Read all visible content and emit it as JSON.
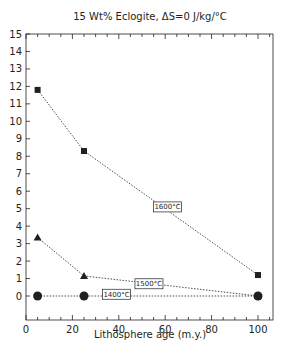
{
  "chart_data": {
    "type": "line",
    "title": "15 Wt% Eclogite, ΔS=0 J/kg/°C",
    "xlabel": "Lithosphere age (m.y.)",
    "ylabel": "",
    "xlim": [
      0,
      106
    ],
    "ylim": [
      0,
      15
    ],
    "xticks": [
      0,
      20,
      40,
      60,
      80,
      100
    ],
    "xtick_labels": [
      "0",
      "20",
      "40",
      "60",
      "80",
      "100"
    ],
    "yticks": [
      0,
      1,
      2,
      3,
      4,
      5,
      6,
      7,
      8,
      9,
      10,
      11,
      12,
      13,
      14,
      15
    ],
    "ytick_labels": [
      "0",
      "1",
      "2",
      "3",
      "4",
      "5",
      "6",
      "7",
      "8",
      "9",
      "10",
      "11",
      "12",
      "13",
      "14",
      "15"
    ],
    "grid": false,
    "legend": "inline labels",
    "series": [
      {
        "name": "1600°C",
        "marker": "square",
        "line": "dotted",
        "x": [
          5,
          25,
          100
        ],
        "y": [
          11.8,
          8.3,
          1.2
        ],
        "label_pos": [
          61,
          5.1
        ]
      },
      {
        "name": "1500°C",
        "marker": "triangle",
        "line": "dotted",
        "x": [
          5,
          25,
          100
        ],
        "y": [
          3.35,
          1.15,
          0.0
        ],
        "label_pos": [
          53,
          0.7
        ]
      },
      {
        "name": "1400°C",
        "marker": "circle",
        "line": "dotted",
        "x": [
          5,
          25,
          100
        ],
        "y": [
          0.0,
          0.0,
          0.0
        ],
        "label_pos": [
          39,
          0.1
        ]
      }
    ]
  }
}
